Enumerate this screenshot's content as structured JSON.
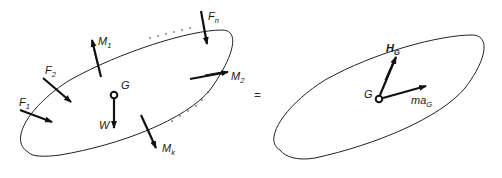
{
  "diagram": {
    "left_body": {
      "center_label": "G",
      "weight_label": "W",
      "forces": [
        {
          "label": "F",
          "sub": "1"
        },
        {
          "label": "F",
          "sub": "2"
        },
        {
          "label": "F",
          "sub": "n"
        }
      ],
      "moments": [
        {
          "label": "M",
          "sub": "1"
        },
        {
          "label": "M",
          "sub": "2"
        },
        {
          "label": "M",
          "sub": "k"
        }
      ]
    },
    "equals_sign": "=",
    "right_body": {
      "center_label": "G",
      "angular_momentum": {
        "label": "H",
        "sub": "G"
      },
      "inertia_force": {
        "label": "ma",
        "sub": "G"
      }
    }
  }
}
